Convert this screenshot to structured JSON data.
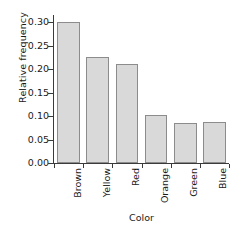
{
  "chart_data": {
    "type": "bar",
    "title": "",
    "subtitle": "",
    "xlabel": "Color",
    "ylabel": "Relative frequency",
    "categories": [
      "Brown",
      "Yellow",
      "Red",
      "Orange",
      "Green",
      "Blue"
    ],
    "values": [
      0.3,
      0.225,
      0.21,
      0.102,
      0.086,
      0.087
    ],
    "series": [
      {
        "name": "Relative frequency",
        "values": [
          0.3,
          0.225,
          0.21,
          0.102,
          0.086,
          0.087
        ]
      }
    ],
    "ylim": [
      0.0,
      0.315
    ],
    "xlim": [
      0,
      6
    ],
    "yticks": [
      0.0,
      0.05,
      0.1,
      0.15,
      0.2,
      0.25,
      0.3
    ],
    "ytick_labels": [
      "0.00",
      "0.05",
      "0.10",
      "0.15",
      "0.20",
      "0.25",
      "0.30"
    ],
    "grid": false,
    "legend": false,
    "legend_position": "none",
    "bar_fill_color": "#d9d9d9",
    "bar_edge_color": "#8c8c8c",
    "axis_color": "#3a3a3a",
    "background_color": "#ffffff",
    "tick_direction": "out",
    "category_label_rotation": 90,
    "bar_width_fraction": 0.78
  }
}
